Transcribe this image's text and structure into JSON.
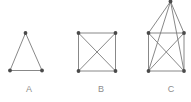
{
  "figure": {
    "width": 191,
    "height": 102,
    "background_color": "#ffffff",
    "edge_color": "#7b7b7b",
    "vertex_color": "#4a4a4a",
    "label_color": "#8d8d8d",
    "vertex_radius": 1.9,
    "edge_width": 0.9
  },
  "graphs": [
    {
      "id": "graph-a",
      "label": "A",
      "label_x": 19,
      "label_y": 84,
      "description": "complete graph K3 (triangle)",
      "vertex_count": 3,
      "edge_count": 3,
      "vertices": [
        {
          "name": "a1",
          "x": 25.5,
          "y": 33.0
        },
        {
          "name": "a2",
          "x": 10.0,
          "y": 70.5
        },
        {
          "name": "a3",
          "x": 42.0,
          "y": 70.5
        }
      ],
      "edges": [
        {
          "from": 0,
          "to": 1
        },
        {
          "from": 0,
          "to": 2
        },
        {
          "from": 1,
          "to": 2
        }
      ]
    },
    {
      "id": "graph-b",
      "label": "B",
      "label_x": 91,
      "label_y": 84,
      "description": "complete graph K4 (square with both diagonals)",
      "vertex_count": 4,
      "edge_count": 6,
      "vertices": [
        {
          "name": "b1",
          "x": 78.5,
          "y": 33.0
        },
        {
          "name": "b2",
          "x": 115.5,
          "y": 33.0
        },
        {
          "name": "b3",
          "x": 78.5,
          "y": 71.0
        },
        {
          "name": "b4",
          "x": 115.5,
          "y": 71.0
        }
      ],
      "edges": [
        {
          "from": 0,
          "to": 1
        },
        {
          "from": 0,
          "to": 2
        },
        {
          "from": 1,
          "to": 3
        },
        {
          "from": 2,
          "to": 3
        },
        {
          "from": 0,
          "to": 3
        },
        {
          "from": 1,
          "to": 2
        }
      ]
    },
    {
      "id": "graph-c",
      "label": "C",
      "label_x": 161,
      "label_y": 84,
      "description": "complete graph K5 (square with both diagonals plus apex joined to all four)",
      "vertex_count": 5,
      "edge_count": 10,
      "vertices": [
        {
          "name": "c1",
          "x": 170.5,
          "y": 1.5
        },
        {
          "name": "c2",
          "x": 148.5,
          "y": 33.0
        },
        {
          "name": "c3",
          "x": 184.0,
          "y": 33.0
        },
        {
          "name": "c4",
          "x": 148.5,
          "y": 71.0
        },
        {
          "name": "c5",
          "x": 184.0,
          "y": 71.0
        }
      ],
      "edges": [
        {
          "from": 0,
          "to": 1
        },
        {
          "from": 0,
          "to": 2
        },
        {
          "from": 0,
          "to": 3
        },
        {
          "from": 0,
          "to": 4
        },
        {
          "from": 1,
          "to": 2
        },
        {
          "from": 1,
          "to": 3
        },
        {
          "from": 2,
          "to": 4
        },
        {
          "from": 3,
          "to": 4
        },
        {
          "from": 1,
          "to": 4
        },
        {
          "from": 2,
          "to": 3
        }
      ]
    }
  ]
}
